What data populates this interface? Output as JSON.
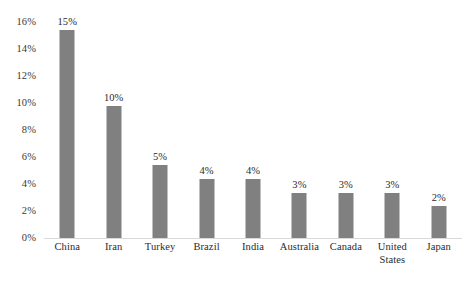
{
  "chart_data": {
    "type": "bar",
    "title": "",
    "xlabel": "",
    "ylabel": "",
    "ylim": [
      0,
      16
    ],
    "grid": false,
    "legend": null,
    "categories": [
      "China",
      "Iran",
      "Turkey",
      "Brazil",
      "India",
      "Australia",
      "Canada",
      "United States",
      "Japan"
    ],
    "values": [
      15.4,
      9.8,
      5.4,
      4.4,
      4.4,
      3.3,
      3.3,
      3.3,
      2.4
    ],
    "data_labels": [
      "15%",
      "10%",
      "5%",
      "4%",
      "4%",
      "3%",
      "3%",
      "3%",
      "2%"
    ],
    "y_ticks": [
      0,
      2,
      4,
      6,
      8,
      10,
      12,
      14,
      16
    ],
    "y_tick_labels": [
      "0%",
      "2%",
      "4%",
      "6%",
      "8%",
      "10%",
      "12%",
      "14%",
      "16%"
    ],
    "bar_color": "#808080",
    "baseline_color": "#d9d9d9",
    "background_color": "#ffffff"
  }
}
